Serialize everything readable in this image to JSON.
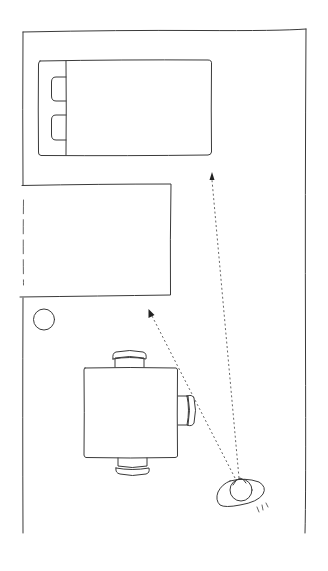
{
  "diagram": {
    "title": "Room floor plan sketch with sightline arrows",
    "style": "hand-drawn pencil line sketch",
    "line_color": "#3a3a3a",
    "background": "#ffffff",
    "elements": [
      {
        "id": "room",
        "label": "Room walls (open at bottom)"
      },
      {
        "id": "bed",
        "label": "Bed with two pillows"
      },
      {
        "id": "cabinet",
        "label": "Rectangular furniture against left wall"
      },
      {
        "id": "plant",
        "label": "Round object (stool / plant)"
      },
      {
        "id": "table",
        "label": "Square table with three chairs"
      },
      {
        "id": "person",
        "label": "Person viewed from above"
      }
    ],
    "sightlines": [
      {
        "id": "to-bed",
        "label": "Sightline toward bed area"
      },
      {
        "id": "to-cabinet",
        "label": "Sightline toward cabinet area"
      }
    ]
  }
}
